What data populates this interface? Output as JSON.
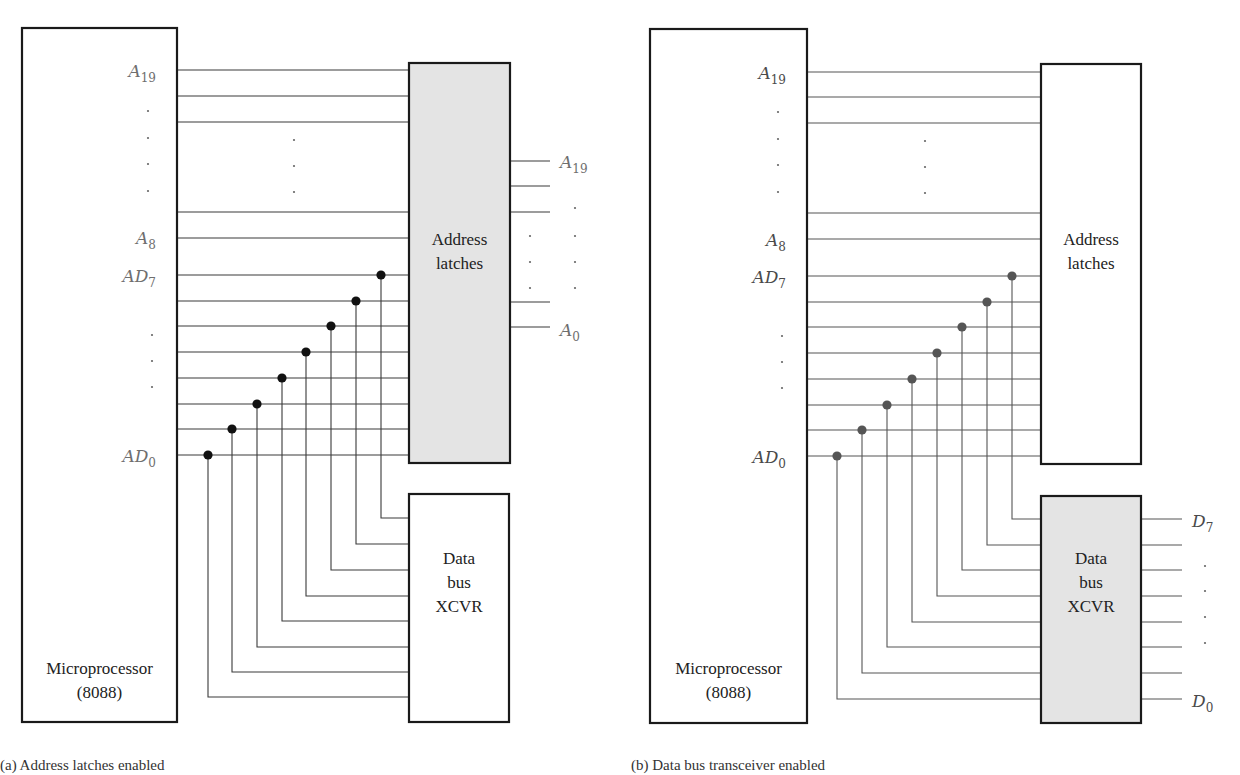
{
  "figure": {
    "panels": [
      {
        "id": "a",
        "caption": "(a)  Address latches enabled",
        "enabled_block": "address_latches",
        "microprocessor": {
          "label_line1": "Microprocessor",
          "label_line2": "(8088)",
          "box": {
            "x": 22,
            "y": 28,
            "w": 155,
            "h": 694
          }
        },
        "address_latches": {
          "label_line1": "Address",
          "label_line2": "latches",
          "box": {
            "x": 409,
            "y": 63,
            "w": 101,
            "h": 400
          },
          "shaded": true,
          "outputs_y": [
            161,
            186,
            212,
            302,
            327
          ],
          "output_x_end": 550,
          "output_labels": [
            {
              "base": "A",
              "sub": "19",
              "y": 168
            },
            {
              "base": "A",
              "sub": "0",
              "y": 336
            }
          ]
        },
        "data_bus_xcvr": {
          "label_line1": "Data",
          "label_line2": "bus",
          "label_line3": "XCVR",
          "box": {
            "x": 409,
            "y": 494,
            "w": 100,
            "h": 228
          },
          "shaded": false,
          "inputs_y": [
            518,
            544,
            570,
            596,
            621,
            647,
            672,
            697
          ],
          "outputs_y": []
        },
        "address_lines_y": [
          70,
          96,
          122,
          212,
          238
        ],
        "ad_lines_y": [
          275,
          301,
          326,
          352,
          378,
          404,
          429,
          455
        ],
        "tap_x": [
          381,
          356,
          331,
          306,
          282,
          257,
          232,
          208
        ],
        "pin_labels": [
          {
            "base": "A",
            "sub": "19",
            "y": 77
          },
          {
            "base": "A",
            "sub": "8",
            "y": 244
          },
          {
            "base": "AD",
            "sub": "7",
            "y": 282
          },
          {
            "base": "AD",
            "sub": "0",
            "y": 462
          }
        ],
        "pin_label_right_x": 168
      },
      {
        "id": "b",
        "caption": "(b)  Data bus transceiver enabled",
        "enabled_block": "data_bus_xcvr",
        "microprocessor": {
          "label_line1": "Microprocessor",
          "label_line2": "(8088)",
          "box": {
            "x": 650,
            "y": 29,
            "w": 157,
            "h": 694
          }
        },
        "address_latches": {
          "label_line1": "Address",
          "label_line2": "latches",
          "box": {
            "x": 1041,
            "y": 64,
            "w": 100,
            "h": 400
          },
          "shaded": false,
          "outputs_y": [],
          "output_x_end": 0,
          "output_labels": []
        },
        "data_bus_xcvr": {
          "label_line1": "Data",
          "label_line2": "bus",
          "label_line3": "XCVR",
          "box": {
            "x": 1041,
            "y": 496,
            "w": 100,
            "h": 227
          },
          "shaded": true,
          "inputs_y": [
            519,
            545,
            570,
            596,
            622,
            647,
            673,
            699
          ],
          "outputs_y": [
            519,
            545,
            570,
            596,
            622,
            647,
            673,
            699
          ],
          "output_x_end": 1182,
          "output_labels": [
            {
              "base": "D",
              "sub": "7",
              "y": 527
            },
            {
              "base": "D",
              "sub": "0",
              "y": 707
            }
          ]
        },
        "address_lines_y": [
          72,
          97,
          123,
          213,
          239
        ],
        "ad_lines_y": [
          276,
          302,
          327,
          353,
          379,
          405,
          430,
          456
        ],
        "tap_x": [
          1012,
          987,
          962,
          937,
          912,
          887,
          862,
          837
        ],
        "pin_labels": [
          {
            "base": "A",
            "sub": "19",
            "y": 79
          },
          {
            "base": "A",
            "sub": "8",
            "y": 246
          },
          {
            "base": "AD",
            "sub": "7",
            "y": 283
          },
          {
            "base": "AD",
            "sub": "0",
            "y": 463
          }
        ],
        "pin_label_right_x": 798
      }
    ]
  }
}
